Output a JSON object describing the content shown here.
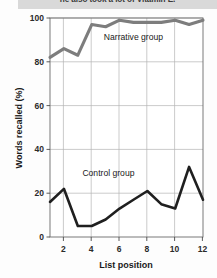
{
  "caption": {
    "text": "he also took a lot of Vitamin E."
  },
  "chart_data": {
    "type": "line",
    "title": "",
    "xlabel": "List position",
    "ylabel": "Words recalled (%)",
    "x": [
      1,
      2,
      3,
      4,
      5,
      6,
      7,
      8,
      9,
      10,
      11,
      12
    ],
    "xlim": [
      1,
      12
    ],
    "ylim": [
      0,
      100
    ],
    "xticks": [
      2,
      4,
      6,
      8,
      10,
      12
    ],
    "xtick_labels": [
      "2",
      "4",
      "6",
      "8",
      "10",
      "12"
    ],
    "yticks": [
      0,
      20,
      40,
      60,
      80,
      100
    ],
    "ytick_labels": [
      "0",
      "20",
      "40",
      "60",
      "80",
      "100"
    ],
    "grid": true,
    "legend_position": "inline-annotation",
    "series": [
      {
        "name": "Narrative group",
        "color": "#7d7d7d",
        "label_x": 7.0,
        "label_y": 90,
        "values": [
          82,
          86,
          83,
          97,
          96,
          99,
          98,
          98,
          98,
          99,
          97,
          99
        ]
      },
      {
        "name": "Control group",
        "color": "#1f1f1f",
        "label_x": 5.2,
        "label_y": 28,
        "values": [
          16,
          22,
          5,
          5,
          8,
          13,
          17,
          21,
          15,
          13,
          32,
          17
        ]
      }
    ]
  }
}
